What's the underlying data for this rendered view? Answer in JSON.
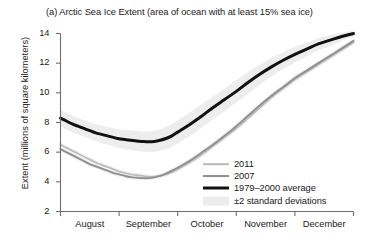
{
  "chart_data": {
    "type": "line",
    "title": "(a) Arctic Sea Ice Extent (area of ocean with at least 15% sea ice)",
    "xlabel": "",
    "ylabel": "Extent (millions of square kilometers)",
    "ylim": [
      2,
      14
    ],
    "yticks": [
      2,
      4,
      6,
      8,
      10,
      12,
      14
    ],
    "ytick_labels": [
      "2",
      "4",
      "6",
      "8",
      "10",
      "12",
      "14"
    ],
    "xtick_labels": [
      "August",
      "September",
      "October",
      "November",
      "December"
    ],
    "x_months": [
      "Aug",
      "Sep",
      "Oct",
      "Nov",
      "Dec"
    ],
    "grid": false,
    "legend_position": "bottom-right",
    "colors": {
      "2011": "#b9b9b9",
      "2007": "#8f8f8f",
      "average": "#111111",
      "band": "#ededed",
      "axis": "#6e6e6e"
    },
    "series": [
      {
        "name": "2011",
        "color": "#b9b9b9",
        "x": [
          0.0,
          0.1,
          0.2,
          0.3,
          0.4,
          0.5,
          0.6,
          0.7,
          0.8,
          0.9,
          1.0,
          1.1,
          1.2,
          1.3,
          1.4,
          1.5,
          1.6,
          1.7,
          1.8,
          1.9,
          2.0,
          2.2,
          2.4,
          2.6,
          2.8,
          3.0,
          3.2,
          3.4,
          3.6,
          3.8,
          4.0,
          4.2,
          4.4,
          4.6,
          4.8,
          5.0
        ],
        "values": [
          6.5,
          6.3,
          6.1,
          5.9,
          5.7,
          5.5,
          5.3,
          5.15,
          5.0,
          4.85,
          4.7,
          4.6,
          4.5,
          4.45,
          4.4,
          4.35,
          4.35,
          4.4,
          4.5,
          4.65,
          4.85,
          5.3,
          5.8,
          6.4,
          7.0,
          7.6,
          8.3,
          9.0,
          9.7,
          10.3,
          10.9,
          11.4,
          11.9,
          12.4,
          12.9,
          13.4
        ]
      },
      {
        "name": "2007",
        "color": "#8f8f8f",
        "x": [
          0.0,
          0.1,
          0.2,
          0.3,
          0.4,
          0.5,
          0.6,
          0.7,
          0.8,
          0.9,
          1.0,
          1.1,
          1.2,
          1.3,
          1.4,
          1.5,
          1.6,
          1.7,
          1.8,
          1.9,
          2.0,
          2.2,
          2.4,
          2.6,
          2.8,
          3.0,
          3.2,
          3.4,
          3.6,
          3.8,
          4.0,
          4.2,
          4.4,
          4.6,
          4.8,
          5.0
        ],
        "values": [
          6.2,
          6.0,
          5.8,
          5.6,
          5.4,
          5.2,
          5.05,
          4.9,
          4.75,
          4.6,
          4.5,
          4.4,
          4.32,
          4.28,
          4.25,
          4.25,
          4.3,
          4.4,
          4.55,
          4.75,
          4.95,
          5.4,
          5.95,
          6.5,
          7.1,
          7.75,
          8.45,
          9.15,
          9.8,
          10.4,
          11.0,
          11.5,
          12.0,
          12.5,
          13.0,
          13.5
        ]
      },
      {
        "name": "1979–2000 average",
        "color": "#111111",
        "x": [
          0.0,
          0.1,
          0.2,
          0.3,
          0.4,
          0.5,
          0.6,
          0.7,
          0.8,
          0.9,
          1.0,
          1.1,
          1.2,
          1.3,
          1.4,
          1.5,
          1.6,
          1.7,
          1.8,
          1.9,
          2.0,
          2.2,
          2.4,
          2.6,
          2.8,
          3.0,
          3.2,
          3.4,
          3.6,
          3.8,
          4.0,
          4.2,
          4.4,
          4.6,
          4.8,
          5.0
        ],
        "values": [
          8.3,
          8.1,
          7.9,
          7.75,
          7.6,
          7.45,
          7.3,
          7.2,
          7.1,
          7.0,
          6.9,
          6.85,
          6.8,
          6.75,
          6.72,
          6.7,
          6.72,
          6.8,
          6.92,
          7.1,
          7.35,
          7.85,
          8.4,
          9.0,
          9.55,
          10.1,
          10.7,
          11.25,
          11.75,
          12.2,
          12.6,
          12.95,
          13.3,
          13.55,
          13.8,
          14.0
        ]
      }
    ],
    "band": {
      "name": "±2 standard deviations",
      "color": "#ededed",
      "x": [
        0.0,
        0.1,
        0.2,
        0.3,
        0.4,
        0.5,
        0.6,
        0.7,
        0.8,
        0.9,
        1.0,
        1.1,
        1.2,
        1.3,
        1.4,
        1.5,
        1.6,
        1.7,
        1.8,
        1.9,
        2.0,
        2.2,
        2.4,
        2.6,
        2.8,
        3.0,
        3.2,
        3.4,
        3.6,
        3.8,
        4.0,
        4.2,
        4.4,
        4.6,
        4.8,
        5.0
      ],
      "upper": [
        8.85,
        8.65,
        8.45,
        8.3,
        8.15,
        8.0,
        7.88,
        7.78,
        7.7,
        7.62,
        7.55,
        7.5,
        7.46,
        7.42,
        7.4,
        7.4,
        7.44,
        7.55,
        7.7,
        7.9,
        8.15,
        8.65,
        9.2,
        9.75,
        10.3,
        10.85,
        11.4,
        11.9,
        12.35,
        12.75,
        13.1,
        13.4,
        13.7,
        13.9,
        14.05,
        14.2
      ],
      "lower": [
        7.75,
        7.55,
        7.35,
        7.2,
        7.05,
        6.9,
        6.75,
        6.62,
        6.5,
        6.4,
        6.3,
        6.22,
        6.15,
        6.1,
        6.05,
        6.02,
        6.02,
        6.1,
        6.2,
        6.35,
        6.58,
        7.08,
        7.62,
        8.2,
        8.78,
        9.35,
        9.95,
        10.55,
        11.1,
        11.6,
        12.05,
        12.45,
        12.85,
        13.15,
        13.5,
        13.8
      ]
    },
    "legend": [
      {
        "label": "2011",
        "color": "#b9b9b9",
        "type": "line",
        "width": 1.6
      },
      {
        "label": "2007",
        "color": "#8f8f8f",
        "type": "line",
        "width": 1.9
      },
      {
        "label": "1979–2000 average",
        "color": "#111111",
        "type": "line",
        "width": 3.0
      },
      {
        "label": "±2 standard deviations",
        "color": "#ededed",
        "type": "patch",
        "width": 9
      }
    ]
  }
}
